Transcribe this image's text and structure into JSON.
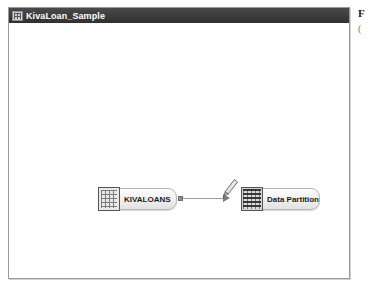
{
  "window": {
    "title": "KivaLoan_Sample",
    "title_icon": "table-grid-icon"
  },
  "canvas": {
    "nodes": [
      {
        "id": "kivaloans",
        "label": "KIVALOANS",
        "icon": "table-icon",
        "x": 92,
        "y": 165
      },
      {
        "id": "data-partition",
        "label": "Data Partition",
        "icon": "partition-icon",
        "x": 235,
        "y": 165
      }
    ],
    "connector": {
      "from": "kivaloans",
      "to": "data-partition",
      "arrow": "arrow-right-icon",
      "port": "output-port"
    },
    "cursor": {
      "icon": "pencil-cursor-icon"
    }
  },
  "right_fragment": {
    "line1": "F",
    "line2": "("
  },
  "colors": {
    "titlebar": "#3b3b3b",
    "titlebar_text": "#ffffff",
    "window_border": "#9a9a9a",
    "canvas_background": "#ffffff",
    "node_fill": "#efefef",
    "node_border": "#b6b6b6",
    "connector": "#9b9b9b"
  }
}
